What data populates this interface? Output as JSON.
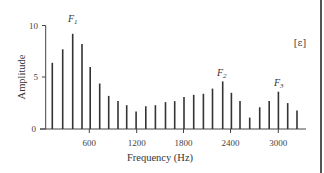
{
  "chart_data": {
    "type": "bar",
    "title": "",
    "xlabel": "Frequency (Hz)",
    "ylabel": "Amplitude",
    "xlim": [
      40,
      3300
    ],
    "ylim": [
      0,
      10
    ],
    "grid": false,
    "x_ticks": [
      600,
      1200,
      1800,
      2400,
      3000
    ],
    "x_tick_labels": [
      "600",
      "1200",
      "1800",
      "2400",
      "3000"
    ],
    "y_ticks": [
      0,
      5,
      10
    ],
    "y_tick_labels": [
      "0",
      "5",
      "10"
    ],
    "annotations": [
      {
        "text": "F",
        "sub": "1",
        "x": 390,
        "y": 9.2
      },
      {
        "text": "F",
        "sub": "2",
        "x": 2340,
        "y": 4.6
      },
      {
        "text": "F",
        "sub": "3",
        "x": 3000,
        "y": 3.6
      },
      {
        "text": "[ɛ]",
        "position": "top-right"
      }
    ],
    "x": [
      130,
      262,
      389,
      507,
      612,
      732,
      846,
      965,
      1075,
      1194,
      1317,
      1440,
      1567,
      1685,
      1803,
      1926,
      2049,
      2164,
      2294,
      2404,
      2514,
      2637,
      2764,
      2884,
      3001,
      3119,
      3237
    ],
    "values": [
      6.4,
      7.7,
      9.2,
      8.2,
      6.0,
      4.4,
      3.2,
      2.7,
      2.3,
      1.7,
      2.2,
      2.3,
      2.6,
      2.7,
      3.1,
      3.3,
      3.4,
      3.9,
      4.6,
      3.5,
      2.7,
      1.1,
      2.1,
      2.7,
      3.6,
      2.5,
      1.8
    ]
  },
  "labels": {
    "y_axis_title": "Amplitude",
    "x_axis_title": "Frequency (Hz)",
    "vowel": "[ɛ]",
    "f1": "F",
    "f1_sub": "1",
    "f2": "F",
    "f2_sub": "2",
    "f3": "F",
    "f3_sub": "3",
    "y0": "0",
    "y5": "5",
    "y10": "10",
    "x600": "600",
    "x1200": "1200",
    "x1800": "1800",
    "x2400": "2400",
    "x3000": "3000"
  }
}
